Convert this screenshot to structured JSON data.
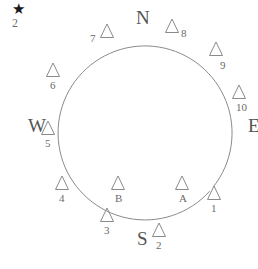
{
  "figure": {
    "type": "compass-ring-diagram",
    "background_color": "#ffffff",
    "stroke_color": "#8a8a8a",
    "text_color": "#6a6a6a"
  },
  "star": {
    "glyph": "★",
    "label": "2",
    "x": 12,
    "y": 2
  },
  "circle": {
    "center_x": 145,
    "center_y": 133,
    "radius": 87,
    "gap_start_deg": 318,
    "gap_end_deg": 322
  },
  "cardinals": [
    {
      "label": "N",
      "x": 136,
      "y": 8
    },
    {
      "label": "E",
      "x": 248,
      "y": 116
    },
    {
      "label": "S",
      "x": 137,
      "y": 229
    },
    {
      "label": "W",
      "x": 28,
      "y": 116
    }
  ],
  "markers": [
    {
      "label": "1",
      "x": 214,
      "y": 193,
      "tag_pos": "below"
    },
    {
      "label": "2",
      "x": 159,
      "y": 230,
      "tag_pos": "below"
    },
    {
      "label": "3",
      "x": 107,
      "y": 215,
      "tag_pos": "below"
    },
    {
      "label": "4",
      "x": 62,
      "y": 183,
      "tag_pos": "below"
    },
    {
      "label": "5",
      "x": 48,
      "y": 128,
      "tag_pos": "below"
    },
    {
      "label": "6",
      "x": 53,
      "y": 70,
      "tag_pos": "below"
    },
    {
      "label": "7",
      "x": 107,
      "y": 31,
      "tag_pos": "left"
    },
    {
      "label": "8",
      "x": 172,
      "y": 26,
      "tag_pos": "right"
    },
    {
      "label": "9",
      "x": 216,
      "y": 49,
      "tag_pos": "belowright"
    },
    {
      "label": "10",
      "x": 239,
      "y": 92,
      "tag_pos": "below"
    },
    {
      "label": "A",
      "x": 182,
      "y": 183,
      "tag_pos": "below"
    },
    {
      "label": "B",
      "x": 118,
      "y": 183,
      "tag_pos": "below"
    }
  ]
}
